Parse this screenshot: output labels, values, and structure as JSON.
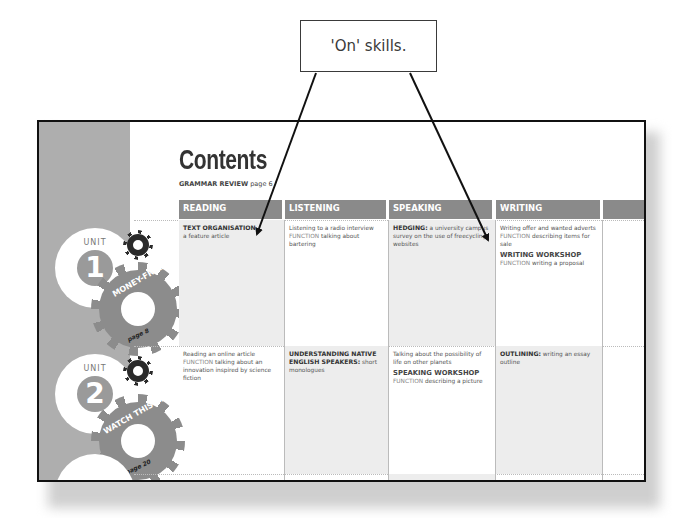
{
  "callout": {
    "text": "'On' skills."
  },
  "page": {
    "title": "Contents",
    "grammar_review": {
      "label": "GRAMMAR REVIEW",
      "page": "page 6"
    },
    "columns": [
      "READING",
      "LISTENING",
      "SPEAKING",
      "WRITING",
      ""
    ],
    "units": [
      {
        "unit_label": "UNIT",
        "number": "1",
        "title": "MONEY-FREE",
        "page": "page 8",
        "cells": {
          "reading": {
            "strong": "TEXT ORGANISATION",
            "text": "a feature article",
            "shaded": true
          },
          "listening": {
            "text": "Listening to a radio interview",
            "function_label": "FUNCTION",
            "function_text": "talking about bartering",
            "shaded": false
          },
          "speaking": {
            "strong": "HEDGING:",
            "text": "a university campus survey on the use of freecycling websites",
            "shaded": true
          },
          "writing": {
            "text": "Writing offer and wanted adverts",
            "function_label": "FUNCTION",
            "function_text": "describing items for sale",
            "workshop": "WRITING WORKSHOP",
            "workshop_function_label": "FUNCTION",
            "workshop_function_text": "writing a proposal",
            "shaded": false
          }
        }
      },
      {
        "unit_label": "UNIT",
        "number": "2",
        "title": "WATCH THIS SPACE",
        "page": "page 20",
        "cells": {
          "reading": {
            "text": "Reading an online article",
            "function_label": "FUNCTION",
            "function_text": "talking about an innovation inspired by science fiction",
            "shaded": false
          },
          "listening": {
            "strong": "UNDERSTANDING NATIVE ENGLISH SPEAKERS:",
            "text": "short monologues",
            "shaded": true
          },
          "speaking": {
            "text": "Talking about the possibility of life on other planets",
            "workshop": "SPEAKING WORKSHOP",
            "workshop_function_label": "FUNCTION",
            "workshop_function_text": "describing a picture",
            "shaded": false
          },
          "writing": {
            "strong": "OUTLINING:",
            "text": "writing an essay outline",
            "shaded": true
          }
        }
      }
    ]
  }
}
